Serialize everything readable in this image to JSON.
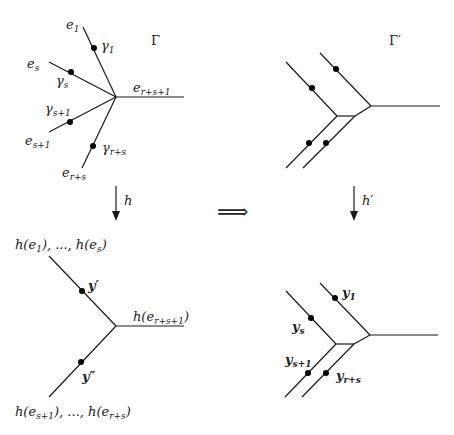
{
  "graph_gamma": {
    "title": "Γ",
    "edges": [
      {
        "label": "e",
        "sub": "1",
        "point": "γ",
        "point_sub": "1"
      },
      {
        "label": "e",
        "sub": "s",
        "point": "γ",
        "point_sub": "s"
      },
      {
        "label": "e",
        "sub": "s+1",
        "point": "γ",
        "point_sub": "s+1"
      },
      {
        "label": "e",
        "sub": "r+s",
        "point": "γ",
        "point_sub": "r+s"
      },
      {
        "label": "e",
        "sub": "r+s+1"
      }
    ]
  },
  "graph_gamma_prime": {
    "title": "Γ′"
  },
  "arrows": {
    "left": "h",
    "right": "h′",
    "implies": "⟹"
  },
  "graph_h": {
    "top_label": "h(e₁), ..., h(eₛ)",
    "top_label_parts": {
      "pre": "h(e",
      "s1": "1",
      "mid": "), ..., h(e",
      "s2": "s",
      "post": ")"
    },
    "right_label_parts": {
      "pre": "h(e",
      "s1": "r+s+1",
      "post": ")"
    },
    "bottom_label_parts": {
      "pre": "h(e",
      "s1": "s+1",
      "mid": "), ..., h(e",
      "s2": "r+s",
      "post": ")"
    },
    "point_upper": "y′",
    "point_lower": "y″"
  },
  "graph_h_prime": {
    "points": [
      {
        "label": "y",
        "sub": "1"
      },
      {
        "label": "y",
        "sub": "s"
      },
      {
        "label": "y",
        "sub": "s+1"
      },
      {
        "label": "y",
        "sub": "r+s"
      }
    ]
  }
}
